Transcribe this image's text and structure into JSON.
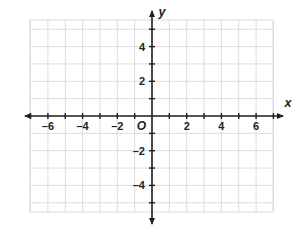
{
  "figure": {
    "title": "",
    "origin_label": "O",
    "x_axis_name": "x",
    "y_axis_name": "y"
  },
  "chart_data": {
    "type": "scatter",
    "title": "",
    "xlabel": "x",
    "ylabel": "y",
    "grid": true,
    "legend": null,
    "series": [],
    "x": [],
    "values": [],
    "xlim": [
      -7,
      7
    ],
    "ylim": [
      -5.5,
      5.5
    ],
    "x_tick_step": 1,
    "y_tick_step": 1,
    "x_labeled_ticks": [
      -6,
      -4,
      -2,
      2,
      4,
      6
    ],
    "y_labeled_ticks": [
      4,
      2,
      -2,
      -4
    ],
    "x_tick_labels": [
      "–6",
      "–4",
      "–2",
      "2",
      "4",
      "6"
    ],
    "y_tick_labels": [
      "4",
      "2",
      "–2",
      "–4"
    ],
    "origin_label": "O",
    "axis_arrows": [
      "left",
      "right",
      "up",
      "down"
    ],
    "grid_color": "#dcdcdc",
    "axis_color": "#231f20",
    "background_color": "#ffffff"
  },
  "geometry": {
    "origin_px_x": 152,
    "origin_px_y": 116,
    "unit_px": 17.35,
    "grid_left": 30,
    "grid_right": 273,
    "grid_top": 20,
    "grid_bottom": 212
  }
}
